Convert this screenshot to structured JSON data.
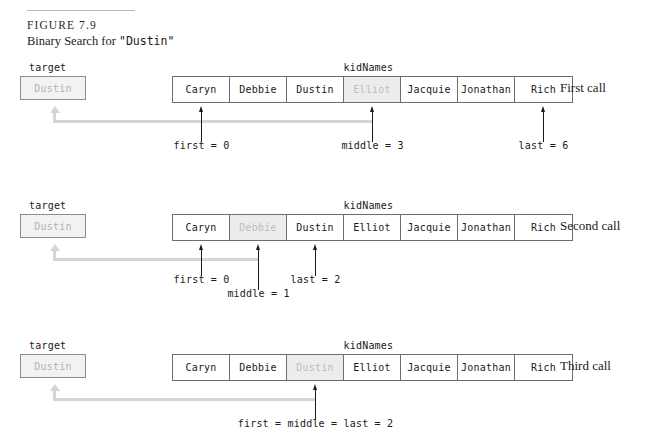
{
  "figure": {
    "number": "FIGURE 7.9",
    "caption_prefix": "Binary Search for ",
    "caption_target": "\"Dustin\""
  },
  "labels": {
    "target": "target",
    "array_name": "kidNames"
  },
  "target_value": "Dustin",
  "array_values": [
    "Caryn",
    "Debbie",
    "Dustin",
    "Elliot",
    "Jacquie",
    "Jonathan",
    "Rich"
  ],
  "rows": [
    {
      "call_label": "First call",
      "target": "Dustin",
      "array_label": "kidNames",
      "highlighted_index": 3,
      "pointers": [
        {
          "name": "first-pointer",
          "index": 0,
          "text": "first = 0"
        },
        {
          "name": "middle-pointer",
          "index": 3,
          "text": "middle = 3"
        },
        {
          "name": "last-pointer",
          "index": 6,
          "text": "last = 6"
        }
      ],
      "return_arrow_to_index": 3
    },
    {
      "call_label": "Second call",
      "target": "Dustin",
      "array_label": "kidNames",
      "highlighted_index": 1,
      "pointers": [
        {
          "name": "first-pointer",
          "index": 0,
          "text": "first = 0"
        },
        {
          "name": "middle-pointer",
          "index": 1,
          "text": "middle = 1"
        },
        {
          "name": "last-pointer",
          "index": 2,
          "text": "last = 2"
        }
      ],
      "return_arrow_to_index": 1
    },
    {
      "call_label": "Third call",
      "target": "Dustin",
      "array_label": "kidNames",
      "highlighted_index": 2,
      "pointers": [
        {
          "name": "first-middle-last-pointer",
          "index": 2,
          "text": "first = middle = last = 2"
        }
      ],
      "return_arrow_to_index": 2
    }
  ],
  "colors": {
    "shaded_cell_bg": "#ececec",
    "shaded_cell_text": "#bdbdbd",
    "gray_arrow": "#d5d5d5",
    "cell_border": "#6e6e6e",
    "target_border": "#8d8d8d",
    "target_bg": "#f2f2f2"
  }
}
